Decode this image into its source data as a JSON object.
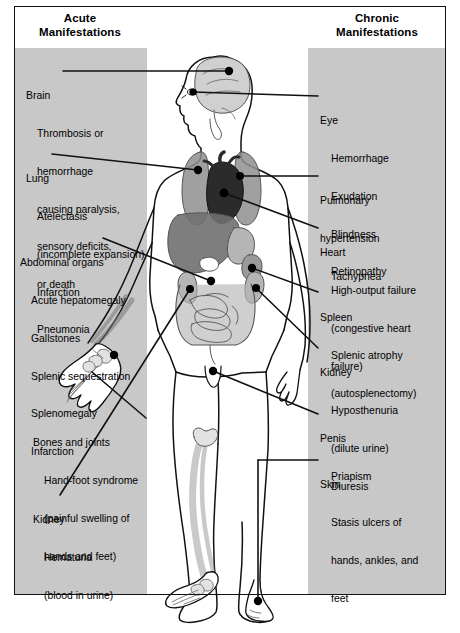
{
  "diagram": {
    "title_left": "Acute\nManifestations",
    "title_right": "Chronic\nManifestations",
    "headers": {
      "left_line1": "Acute",
      "left_line2": "Manifestations",
      "right_line1": "Chronic",
      "right_line2": "Manifestations"
    },
    "colors": {
      "panel_background": "#c8c8c8",
      "page_background": "#ffffff",
      "outline": "#111111",
      "lung": "#8f8f8f",
      "heart": "#2b2b2b",
      "liver": "#707070",
      "bowel": "#b5b5b5",
      "bone": "#d8d8d8",
      "brain": "#d0d0d0",
      "marker_dot": "#000000"
    },
    "acute_manifestations": [
      {
        "id": "brain",
        "organ": "Brain",
        "details": [
          "Thrombosis or",
          "hemorrhage",
          "causing paralysis,",
          "sensory deficits,",
          "or death"
        ]
      },
      {
        "id": "lung",
        "organ": "Lung",
        "details": [
          "Atelectasis",
          "(incomplete expansion)",
          "Infarction",
          "Pneumonia"
        ]
      },
      {
        "id": "abdominal-organs",
        "organ": "Abdominal organs",
        "details": [
          "Acute hepatomegaly",
          "Gallstones",
          "Splenic sequestration",
          "Splenomegaly",
          "Infarction"
        ]
      },
      {
        "id": "bones-and-joints",
        "organ": "Bones and joints",
        "details": [
          "Hand-foot syndrome",
          "(painful swelling of",
          "hands and feet)"
        ]
      },
      {
        "id": "kidney-acute",
        "organ": "Kidney",
        "details": [
          "Hematuria",
          "(blood in urine)"
        ]
      }
    ],
    "chronic_manifestations": [
      {
        "id": "eye",
        "organ": "Eye",
        "details": [
          "Hemorrhage",
          "Exudation",
          "Blindness",
          "Retinopathy"
        ]
      },
      {
        "id": "pulmonary-hypertension",
        "organ": "Pulmonary",
        "details": [
          "hypertension",
          "Tachypnea"
        ]
      },
      {
        "id": "heart",
        "organ": "Heart",
        "details": [
          "High-output failure",
          "(congestive heart",
          "failure)"
        ]
      },
      {
        "id": "spleen",
        "organ": "Spleen",
        "details": [
          "Splenic atrophy",
          "(autosplenectomy)"
        ]
      },
      {
        "id": "kidney-chronic",
        "organ": "Kidney",
        "details": [
          "Hyposthenuria",
          "(dilute urine)",
          "Diuresis"
        ]
      },
      {
        "id": "penis",
        "organ": "Penis",
        "details": [
          "Priapism"
        ]
      },
      {
        "id": "skin",
        "organ": "Skin",
        "details": [
          "Stasis ulcers of",
          "hands, ankles, and",
          "feet"
        ]
      }
    ]
  }
}
